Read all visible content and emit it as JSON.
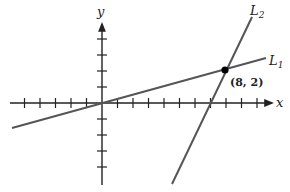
{
  "diagram": {
    "type": "coordinate-plane",
    "axes": {
      "x_label": "x",
      "y_label": "y",
      "x_ticks_negative": 6,
      "x_ticks_positive": 11,
      "y_ticks_positive": 4,
      "y_ticks_negative": 4
    },
    "lines": [
      {
        "name": "L1",
        "label_main": "L",
        "label_sub": "1"
      },
      {
        "name": "L2",
        "label_main": "L",
        "label_sub": "2"
      }
    ],
    "intersection": {
      "label": "(8, 2)",
      "x": 8,
      "y": 2
    },
    "colors": {
      "axis": "#222222",
      "line": "#555555",
      "point": "#000000"
    }
  }
}
